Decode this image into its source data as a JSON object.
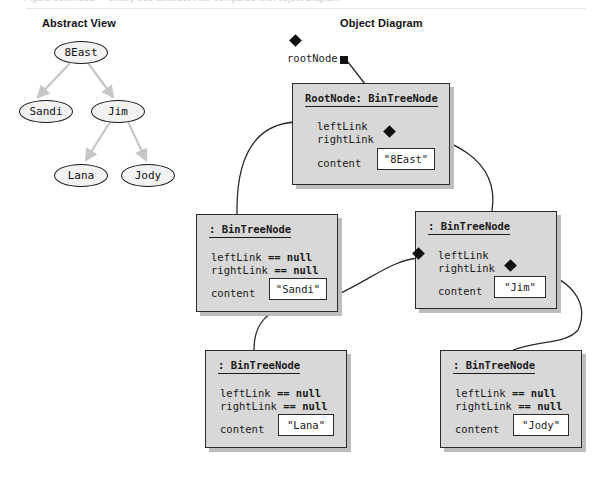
{
  "page": {
    "top_clipped_text": "Figure continued — binary tree abstract view compared with object diagram",
    "headings": {
      "abstract_view": "Abstract View",
      "object_diagram": "Object Diagram"
    }
  },
  "colors": {
    "box_fill": "#d8d8d8",
    "box_border": "#2b2b2b",
    "box_shadow": "#bdbdbd",
    "ellipse_fill": "#f2f2f2",
    "ellipse_border": "#1a1a1a",
    "value_fill": "#ffffff",
    "ink": "#111111",
    "connector": "#2b2b2b"
  },
  "abstract_view": {
    "nodes": [
      {
        "label": "8East",
        "x": 54,
        "y": 41,
        "w": 54,
        "h": 23
      },
      {
        "label": "Sandi",
        "x": 19,
        "y": 100,
        "w": 54,
        "h": 23
      },
      {
        "label": "Jim",
        "x": 91,
        "y": 100,
        "w": 54,
        "h": 23
      },
      {
        "label": "Lana",
        "x": 54,
        "y": 164,
        "w": 54,
        "h": 23
      },
      {
        "label": "Jody",
        "x": 121,
        "y": 164,
        "w": 54,
        "h": 23
      }
    ],
    "edges": [
      {
        "from": "8East",
        "to": "Sandi"
      },
      {
        "from": "8East",
        "to": "Jim"
      },
      {
        "from": "Jim",
        "to": "Lana"
      },
      {
        "from": "Jim",
        "to": "Jody"
      }
    ]
  },
  "object_diagram": {
    "root_pointer": {
      "label": "rootNode",
      "square_x": 340,
      "square_y": 56
    },
    "field_names": {
      "left_link": "leftLink",
      "right_link": "rightLink",
      "content": "content"
    },
    "null_suffix": "== null",
    "boxes": [
      {
        "id": "root",
        "title": "RootNode: BinTreeNode",
        "left_link": "leftLink",
        "right_link": "rightLink",
        "left_is_null": false,
        "right_is_null": false,
        "content_label": "content",
        "content_value": "\"8East\"",
        "x": 292,
        "y": 83,
        "w": 158,
        "h": 102
      },
      {
        "id": "sandi",
        "title": ": BinTreeNode",
        "left_link": "leftLink",
        "right_link": "rightLink",
        "left_is_null": true,
        "right_is_null": true,
        "content_label": "content",
        "content_value": "\"Sandi\"",
        "x": 196,
        "y": 214,
        "w": 142,
        "h": 98
      },
      {
        "id": "jim",
        "title": ": BinTreeNode",
        "left_link": "leftLink",
        "right_link": "rightLink",
        "left_is_null": false,
        "right_is_null": false,
        "content_label": "content",
        "content_value": "\"Jim\"",
        "x": 415,
        "y": 211,
        "w": 142,
        "h": 98
      },
      {
        "id": "lana",
        "title": ": BinTreeNode",
        "left_link": "leftLink",
        "right_link": "rightLink",
        "left_is_null": true,
        "right_is_null": true,
        "content_label": "content",
        "content_value": "\"Lana\"",
        "x": 205,
        "y": 350,
        "w": 142,
        "h": 98
      },
      {
        "id": "jody",
        "title": ": BinTreeNode",
        "left_link": "leftLink",
        "right_link": "rightLink",
        "left_is_null": true,
        "right_is_null": true,
        "content_label": "content",
        "content_value": "\"Jody\"",
        "x": 440,
        "y": 350,
        "w": 142,
        "h": 98
      }
    ],
    "links": [
      {
        "from": "root",
        "side": "left",
        "to": "sandi"
      },
      {
        "from": "root",
        "side": "right",
        "to": "jim"
      },
      {
        "from": "jim",
        "side": "left",
        "to": "lana"
      },
      {
        "from": "jim",
        "side": "right",
        "to": "jody"
      }
    ]
  }
}
